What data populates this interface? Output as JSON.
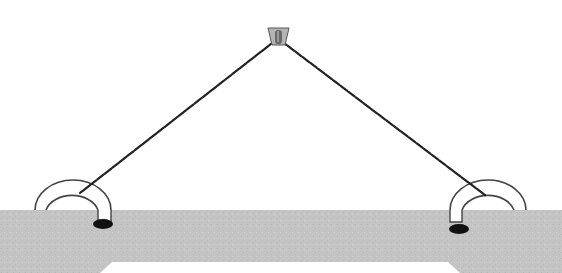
{
  "diagram": {
    "colors": {
      "background": "#ffffff",
      "board": "#c2c2c2",
      "board_cutout": "#ffffff",
      "string": "#222222",
      "anchor_hole": "#111111",
      "staple_outline": "#444444",
      "nail_head": "#9a9a9a"
    },
    "elements": [
      {
        "name": "nail",
        "x": 278,
        "y": 35
      },
      {
        "name": "left-staple",
        "x": 78,
        "y": 210
      },
      {
        "name": "right-staple",
        "x": 485,
        "y": 210
      },
      {
        "name": "left-string",
        "from": [
          278,
          38
        ],
        "to": [
          78,
          195
        ]
      },
      {
        "name": "right-string",
        "from": [
          278,
          38
        ],
        "to": [
          485,
          195
        ]
      },
      {
        "name": "board",
        "top": 210
      }
    ]
  }
}
